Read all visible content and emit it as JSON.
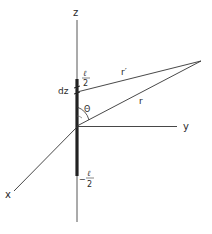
{
  "diagram": {
    "type": "dipole-antenna-geometry",
    "axes": {
      "z": {
        "label": "z"
      },
      "y": {
        "label": "y"
      },
      "x": {
        "label": "x"
      }
    },
    "rod": {
      "top_label_num": "ℓ",
      "top_label_den": "2",
      "bottom_label_sign": "−",
      "bottom_label_num": "ℓ",
      "bottom_label_den": "2"
    },
    "element": {
      "label": "dz"
    },
    "vectors": {
      "r_prime": {
        "label": "r′"
      },
      "r": {
        "label": "r"
      }
    },
    "angle": {
      "label": "Θ"
    },
    "colors": {
      "line": "#2a2a2a",
      "background": "#ffffff"
    }
  }
}
